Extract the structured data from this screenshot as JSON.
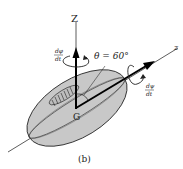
{
  "figure": {
    "caption": "(b)",
    "axis_Z_label": "Z",
    "axis_z_label": "z",
    "center_label": "G",
    "angle_label": "θ = 60°",
    "precession_rate": {
      "numerator": "dφ",
      "denominator": "dt"
    },
    "spin_rate": {
      "numerator": "dψ",
      "denominator": "dt"
    },
    "colors": {
      "body_fill": "#c8c8c8",
      "stroke": "#111111",
      "background": "#ffffff"
    }
  }
}
